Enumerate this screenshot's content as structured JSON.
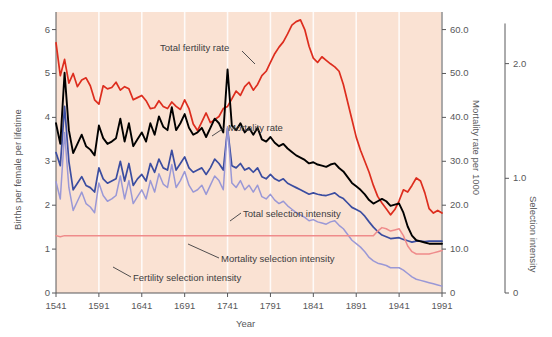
{
  "chart_data": {
    "type": "line",
    "title": "",
    "xlabel": "Year",
    "ylabel": "Births per female per lifetime",
    "ylabel_right_1": "Mortality rate per 1000",
    "ylabel_right_2": "Selection intensity",
    "xlim": [
      1541,
      1991
    ],
    "xticks": [
      1541,
      1591,
      1641,
      1691,
      1741,
      1791,
      1841,
      1891,
      1941,
      1991
    ],
    "xtick_labels": [
      "1541",
      "1591",
      "1641",
      "1691",
      "1741",
      "1791",
      "1841",
      "1891",
      "1941",
      "1991"
    ],
    "ylim_left": [
      0,
      6.4
    ],
    "yticks_left": [
      0,
      1,
      2,
      3,
      4,
      5,
      6
    ],
    "ytick_labels_left": [
      "0",
      "1",
      "2",
      "3",
      "4",
      "5",
      "6"
    ],
    "ylim_right_1": [
      0,
      64.0
    ],
    "yticks_right_1": [
      0,
      10,
      20,
      30,
      40,
      50,
      60
    ],
    "ytick_labels_right_1": [
      "0",
      "10.0",
      "20.0",
      "30.0",
      "40.0",
      "50.0",
      "60.0"
    ],
    "ylim_right_2": [
      0,
      2.45
    ],
    "yticks_right_2": [
      0,
      1.0,
      2.0
    ],
    "ytick_labels_right_2": [
      "0",
      "1.0",
      "2.0"
    ],
    "grid": "vertical-white",
    "legend": "inline-annotations",
    "background_color": "#fae2d3",
    "series": [
      {
        "name": "Total fertility rate",
        "axis": "left",
        "color": "#dd2d1e",
        "annotation": "Total fertility rate",
        "x": [
          1541,
          1546,
          1551,
          1556,
          1561,
          1566,
          1571,
          1576,
          1581,
          1586,
          1591,
          1596,
          1601,
          1606,
          1611,
          1616,
          1621,
          1626,
          1631,
          1636,
          1641,
          1646,
          1651,
          1656,
          1661,
          1666,
          1671,
          1676,
          1681,
          1686,
          1691,
          1696,
          1701,
          1706,
          1711,
          1716,
          1721,
          1726,
          1731,
          1736,
          1741,
          1746,
          1751,
          1756,
          1761,
          1766,
          1771,
          1776,
          1781,
          1786,
          1791,
          1796,
          1801,
          1806,
          1811,
          1816,
          1821,
          1826,
          1831,
          1836,
          1841,
          1846,
          1851,
          1856,
          1861,
          1866,
          1871,
          1876,
          1881,
          1886,
          1891,
          1896,
          1901,
          1906,
          1911,
          1916,
          1921,
          1926,
          1931,
          1936,
          1941,
          1946,
          1951,
          1956,
          1961,
          1966,
          1971,
          1976,
          1981,
          1986,
          1991
        ],
        "y": [
          5.7,
          4.95,
          5.32,
          4.78,
          5.0,
          4.7,
          4.85,
          4.9,
          4.72,
          4.4,
          4.3,
          4.72,
          4.65,
          4.68,
          4.8,
          4.62,
          4.7,
          4.65,
          4.4,
          4.45,
          4.5,
          4.38,
          4.2,
          4.22,
          4.38,
          4.25,
          4.2,
          4.35,
          4.25,
          4.18,
          4.4,
          4.2,
          3.85,
          3.7,
          3.9,
          4.1,
          3.88,
          3.95,
          4.02,
          4.2,
          4.25,
          4.42,
          4.6,
          4.5,
          4.7,
          4.8,
          4.62,
          4.75,
          4.95,
          5.05,
          5.25,
          5.45,
          5.6,
          5.72,
          5.9,
          6.1,
          6.18,
          6.22,
          6.0,
          5.62,
          5.35,
          5.25,
          5.38,
          5.3,
          5.22,
          5.15,
          5.05,
          4.75,
          4.35,
          3.95,
          3.55,
          3.25,
          3.0,
          2.75,
          2.45,
          2.2,
          2.05,
          1.92,
          1.78,
          1.9,
          2.1,
          2.35,
          2.3,
          2.45,
          2.62,
          2.55,
          2.28,
          1.92,
          1.82,
          1.88,
          1.82
        ]
      },
      {
        "name": "Mortality rate",
        "axis": "right-1",
        "color": "#3b4da0",
        "annotation": "Mortality rate",
        "x": [
          1541,
          1546,
          1551,
          1556,
          1561,
          1566,
          1571,
          1576,
          1581,
          1586,
          1591,
          1596,
          1601,
          1606,
          1611,
          1616,
          1621,
          1626,
          1631,
          1636,
          1641,
          1646,
          1651,
          1656,
          1661,
          1666,
          1671,
          1676,
          1681,
          1686,
          1691,
          1696,
          1701,
          1706,
          1711,
          1716,
          1721,
          1726,
          1731,
          1736,
          1741,
          1746,
          1751,
          1756,
          1761,
          1766,
          1771,
          1776,
          1781,
          1786,
          1791,
          1796,
          1801,
          1806,
          1811,
          1816,
          1821,
          1826,
          1831,
          1836,
          1841,
          1846,
          1851,
          1856,
          1861,
          1866,
          1871,
          1876,
          1881,
          1886,
          1891,
          1896,
          1901,
          1906,
          1911,
          1916,
          1921,
          1926,
          1931,
          1936,
          1941,
          1946,
          1951,
          1956,
          1961,
          1966,
          1971,
          1976,
          1981,
          1986,
          1991
        ],
        "y": [
          32.0,
          29.0,
          42.5,
          30.0,
          23.5,
          25.0,
          26.5,
          24.5,
          24.0,
          23.0,
          28.5,
          26.0,
          25.0,
          25.5,
          26.0,
          30.0,
          25.5,
          29.5,
          24.5,
          26.0,
          27.0,
          25.5,
          29.5,
          27.5,
          30.5,
          28.5,
          28.0,
          32.5,
          28.0,
          29.5,
          31.0,
          28.5,
          27.5,
          28.0,
          28.5,
          27.0,
          28.5,
          30.5,
          29.5,
          28.0,
          37.5,
          29.0,
          28.5,
          29.5,
          28.0,
          28.5,
          27.5,
          28.5,
          26.5,
          26.0,
          27.0,
          26.0,
          25.5,
          26.0,
          25.0,
          24.5,
          24.0,
          23.5,
          23.0,
          22.5,
          22.8,
          22.5,
          22.3,
          22.2,
          22.5,
          22.8,
          22.0,
          21.5,
          20.5,
          19.5,
          19.0,
          18.5,
          17.5,
          16.2,
          15.0,
          14.0,
          13.2,
          12.8,
          12.4,
          12.5,
          12.6,
          12.2,
          11.9,
          11.6,
          11.8,
          11.8,
          11.7,
          11.8,
          11.8,
          11.8,
          11.8
        ]
      },
      {
        "name": "Total selection intensity",
        "axis": "right-2",
        "color": "#000000",
        "annotation": "Total selection intensity",
        "x": [
          1541,
          1546,
          1551,
          1556,
          1561,
          1566,
          1571,
          1576,
          1581,
          1586,
          1591,
          1596,
          1601,
          1606,
          1611,
          1616,
          1621,
          1626,
          1631,
          1636,
          1641,
          1646,
          1651,
          1656,
          1661,
          1666,
          1671,
          1676,
          1681,
          1686,
          1691,
          1696,
          1701,
          1706,
          1711,
          1716,
          1721,
          1726,
          1731,
          1736,
          1741,
          1746,
          1751,
          1756,
          1761,
          1766,
          1771,
          1776,
          1781,
          1786,
          1791,
          1796,
          1801,
          1806,
          1811,
          1816,
          1821,
          1826,
          1831,
          1836,
          1841,
          1846,
          1851,
          1856,
          1861,
          1866,
          1871,
          1876,
          1881,
          1886,
          1891,
          1896,
          1901,
          1906,
          1911,
          1916,
          1921,
          1926,
          1931,
          1936,
          1941,
          1946,
          1951,
          1956,
          1961,
          1966,
          1971,
          1976,
          1981,
          1986,
          1991
        ],
        "y": [
          1.48,
          1.3,
          1.92,
          1.42,
          1.22,
          1.3,
          1.38,
          1.28,
          1.25,
          1.2,
          1.46,
          1.35,
          1.3,
          1.32,
          1.35,
          1.52,
          1.32,
          1.48,
          1.28,
          1.34,
          1.4,
          1.32,
          1.48,
          1.38,
          1.54,
          1.45,
          1.42,
          1.62,
          1.42,
          1.48,
          1.56,
          1.44,
          1.38,
          1.4,
          1.44,
          1.36,
          1.44,
          1.52,
          1.48,
          1.4,
          1.95,
          1.46,
          1.42,
          1.48,
          1.4,
          1.44,
          1.38,
          1.44,
          1.34,
          1.32,
          1.36,
          1.31,
          1.28,
          1.3,
          1.26,
          1.23,
          1.2,
          1.18,
          1.16,
          1.13,
          1.14,
          1.12,
          1.11,
          1.1,
          1.12,
          1.13,
          1.09,
          1.06,
          1.01,
          0.96,
          0.93,
          0.9,
          0.86,
          0.81,
          0.78,
          0.8,
          0.82,
          0.8,
          0.76,
          0.77,
          0.78,
          0.7,
          0.58,
          0.5,
          0.46,
          0.45,
          0.44,
          0.43,
          0.43,
          0.43,
          0.43
        ]
      },
      {
        "name": "Mortality selection intensity",
        "axis": "right-2",
        "color": "#9a98d6",
        "annotation": "Mortality selection intensity",
        "x": [
          1541,
          1546,
          1551,
          1556,
          1561,
          1566,
          1571,
          1576,
          1581,
          1586,
          1591,
          1596,
          1601,
          1606,
          1611,
          1616,
          1621,
          1626,
          1631,
          1636,
          1641,
          1646,
          1651,
          1656,
          1661,
          1666,
          1671,
          1676,
          1681,
          1686,
          1691,
          1696,
          1701,
          1706,
          1711,
          1716,
          1721,
          1726,
          1731,
          1736,
          1741,
          1746,
          1751,
          1756,
          1761,
          1766,
          1771,
          1776,
          1781,
          1786,
          1791,
          1796,
          1801,
          1806,
          1811,
          1816,
          1821,
          1826,
          1831,
          1836,
          1841,
          1846,
          1851,
          1856,
          1861,
          1866,
          1871,
          1876,
          1881,
          1886,
          1891,
          1896,
          1901,
          1906,
          1911,
          1916,
          1921,
          1926,
          1931,
          1936,
          1941,
          1946,
          1951,
          1956,
          1961,
          1966,
          1971,
          1976,
          1981,
          1986,
          1991
        ],
        "y": [
          0.97,
          0.82,
          1.4,
          0.92,
          0.72,
          0.8,
          0.88,
          0.78,
          0.75,
          0.7,
          0.96,
          0.85,
          0.8,
          0.82,
          0.85,
          1.02,
          0.82,
          0.98,
          0.78,
          0.84,
          0.9,
          0.82,
          0.98,
          0.88,
          1.04,
          0.95,
          0.92,
          1.12,
          0.92,
          0.98,
          1.06,
          0.94,
          0.88,
          0.9,
          0.94,
          0.86,
          0.94,
          1.02,
          0.98,
          0.9,
          1.45,
          0.96,
          0.92,
          0.98,
          0.9,
          0.94,
          0.88,
          0.94,
          0.84,
          0.82,
          0.86,
          0.81,
          0.78,
          0.8,
          0.76,
          0.73,
          0.7,
          0.68,
          0.66,
          0.63,
          0.64,
          0.62,
          0.61,
          0.6,
          0.62,
          0.63,
          0.59,
          0.56,
          0.51,
          0.46,
          0.43,
          0.4,
          0.36,
          0.31,
          0.28,
          0.26,
          0.25,
          0.24,
          0.22,
          0.22,
          0.22,
          0.2,
          0.17,
          0.14,
          0.12,
          0.11,
          0.1,
          0.09,
          0.08,
          0.07,
          0.06
        ]
      },
      {
        "name": "Fertility selection intensity",
        "axis": "right-2",
        "color": "#ef8b8b",
        "annotation": "Fertility selection intensity",
        "x": [
          1541,
          1546,
          1551,
          1556,
          1561,
          1566,
          1571,
          1576,
          1581,
          1586,
          1591,
          1596,
          1601,
          1606,
          1611,
          1616,
          1621,
          1626,
          1631,
          1636,
          1641,
          1646,
          1651,
          1656,
          1661,
          1666,
          1671,
          1676,
          1681,
          1686,
          1691,
          1696,
          1701,
          1706,
          1711,
          1716,
          1721,
          1726,
          1731,
          1736,
          1741,
          1746,
          1751,
          1756,
          1761,
          1766,
          1771,
          1776,
          1781,
          1786,
          1791,
          1796,
          1801,
          1806,
          1811,
          1816,
          1821,
          1826,
          1831,
          1836,
          1841,
          1846,
          1851,
          1856,
          1861,
          1866,
          1871,
          1876,
          1881,
          1886,
          1891,
          1896,
          1901,
          1906,
          1911,
          1916,
          1921,
          1926,
          1931,
          1936,
          1941,
          1946,
          1951,
          1956,
          1961,
          1966,
          1971,
          1976,
          1981,
          1986,
          1991
        ],
        "y": [
          0.5,
          0.49,
          0.5,
          0.5,
          0.5,
          0.5,
          0.5,
          0.5,
          0.5,
          0.5,
          0.5,
          0.5,
          0.5,
          0.5,
          0.5,
          0.5,
          0.5,
          0.5,
          0.5,
          0.5,
          0.5,
          0.5,
          0.5,
          0.5,
          0.5,
          0.5,
          0.5,
          0.5,
          0.5,
          0.5,
          0.5,
          0.5,
          0.5,
          0.5,
          0.5,
          0.5,
          0.5,
          0.5,
          0.5,
          0.5,
          0.5,
          0.5,
          0.5,
          0.5,
          0.5,
          0.5,
          0.5,
          0.5,
          0.5,
          0.5,
          0.5,
          0.5,
          0.5,
          0.5,
          0.5,
          0.5,
          0.5,
          0.5,
          0.5,
          0.5,
          0.5,
          0.5,
          0.5,
          0.5,
          0.5,
          0.5,
          0.5,
          0.5,
          0.5,
          0.5,
          0.5,
          0.5,
          0.5,
          0.5,
          0.5,
          0.54,
          0.57,
          0.56,
          0.54,
          0.55,
          0.56,
          0.5,
          0.41,
          0.36,
          0.34,
          0.34,
          0.34,
          0.34,
          0.35,
          0.36,
          0.37
        ]
      }
    ]
  }
}
